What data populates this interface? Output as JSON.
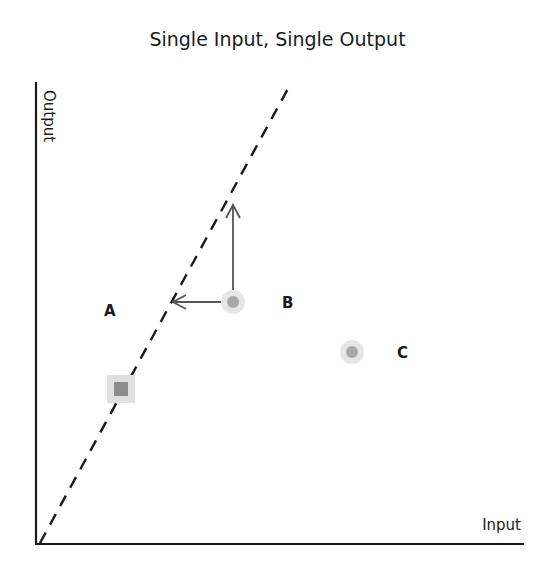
{
  "title": "Single Input, Single Output",
  "axes": {
    "x_label": "Input",
    "y_label": "Output"
  },
  "points": [
    {
      "label": "A",
      "shape": "square",
      "x": 121,
      "y": 389
    },
    {
      "label": "B",
      "shape": "circle",
      "x": 233,
      "y": 302
    },
    {
      "label": "C",
      "shape": "circle",
      "x": 352,
      "y": 352
    }
  ],
  "frontier": {
    "style": "dashed",
    "from": [
      40,
      543
    ],
    "to": [
      290,
      85
    ]
  },
  "arrows": [
    {
      "from": "B",
      "direction": "up"
    },
    {
      "from": "B",
      "direction": "left"
    }
  ],
  "colors": {
    "axis": "#1a1a1a",
    "marker_outer": "#e2e2e2",
    "marker_inner": "#9a9a9a",
    "arrow": "#555555"
  }
}
